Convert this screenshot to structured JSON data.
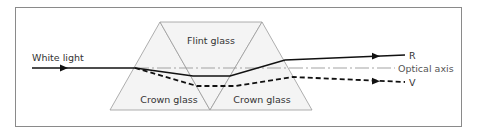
{
  "diagram": {
    "type": "optics",
    "labels": {
      "incoming": "White light",
      "flint": "Flint glass",
      "crown_left": "Crown glass",
      "crown_right": "Crown glass",
      "axis": "Optical axis",
      "ray_red": "R",
      "ray_violet": "V"
    },
    "colors": {
      "frame": "#8a8a8a",
      "prism_fill": "#f4f4f4",
      "prism_edge": "#9a9a9a",
      "ray": "#111111",
      "axis": "#999999"
    }
  }
}
